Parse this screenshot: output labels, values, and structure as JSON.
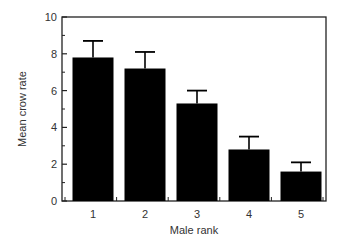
{
  "chart_data": {
    "type": "bar",
    "title": "",
    "xlabel": "Male rank",
    "ylabel": "Mean crow rate",
    "categories": [
      "1",
      "2",
      "3",
      "4",
      "5"
    ],
    "values": [
      7.8,
      7.2,
      5.3,
      2.8,
      1.6
    ],
    "error_upper": [
      8.7,
      8.1,
      6.0,
      3.5,
      2.1
    ],
    "ylim": [
      0,
      10
    ],
    "yticks": [
      0,
      2,
      4,
      6,
      8,
      10
    ],
    "grid": false,
    "legend": null,
    "bar_color": "#000000"
  }
}
